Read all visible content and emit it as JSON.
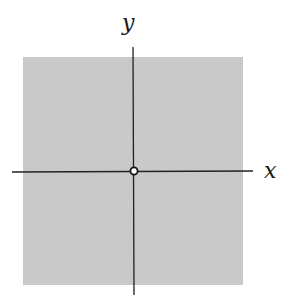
{
  "diagram": {
    "axis_labels": {
      "x": "x",
      "y": "y"
    },
    "region": {
      "fill": "#c8c8c8",
      "description": "shaded square region"
    },
    "origin_point": {
      "style": "open circle"
    },
    "colors": {
      "axis": "#222222",
      "background": "#ffffff"
    }
  }
}
